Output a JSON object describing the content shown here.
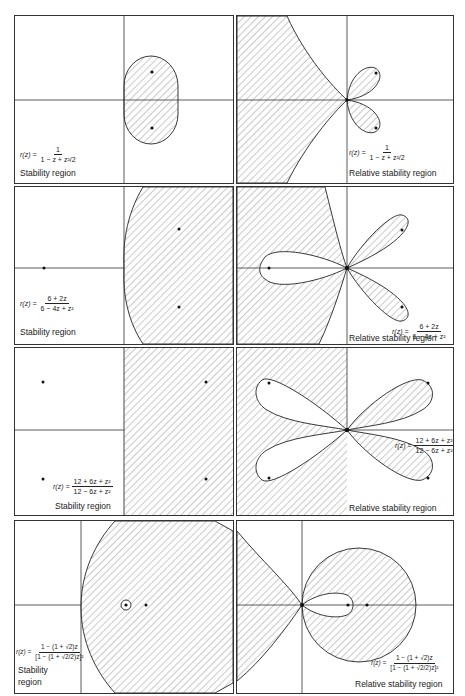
{
  "figure": {
    "columns": [
      "Stability region",
      "Relative stability region"
    ],
    "rows": [
      {
        "id": "row1",
        "formula": {
          "lhs": "r(z) =",
          "numerator": "1",
          "denominator": "1 − z + z²/2"
        },
        "stability": {
          "caption": "Stability region",
          "region": "bounded oval (stadium) right of imaginary axis, symmetric about real axis",
          "marked_points": 2
        },
        "relative": {
          "caption": "Relative stability region",
          "region": "two petals in right half-plane plus shaded unbounded region on left bounded by cusped curves",
          "marked_points": 2
        }
      },
      {
        "id": "row2",
        "formula": {
          "lhs": "r(z) =",
          "numerator": "6 + 2z",
          "denominator": "6 − 4z + z²"
        },
        "stability": {
          "caption": "Stability region",
          "region": "unbounded region right of a curve bulging into left of imaginary axis",
          "marked_points": 3
        },
        "relative": {
          "caption": "Relative stability region",
          "region": "three petals (one left, two right) meeting at origin, shaded left region",
          "marked_points": 3
        }
      },
      {
        "id": "row3",
        "formula": {
          "lhs": "r(z) =",
          "numerator": "12 + 6z + z²",
          "denominator": "12 − 6z + z²"
        },
        "stability": {
          "caption": "Stability region",
          "region": "entire right half-plane",
          "marked_points": 4
        },
        "relative": {
          "caption": "Relative stability region",
          "region": "four petals meeting at origin, left half-plane shaded except left petals",
          "marked_points": 4
        }
      },
      {
        "id": "row4",
        "formula": {
          "lhs": "r(z) =",
          "numerator": "1 − (1 + √2)z",
          "denominator": "[1 − (1 + √2/2)z]²"
        },
        "stability": {
          "caption": "Stability\nregion",
          "caption_lines": [
            "Stability",
            "region"
          ],
          "region": "large disk in right half-plane with a small circled point near its left center",
          "marked_points": 2
        },
        "relative": {
          "caption": "Relative stability region",
          "region": "disk in right half-plane with one interior petal from origin, shaded cusped region on left",
          "marked_points": 2
        }
      }
    ]
  },
  "colors": {
    "ink": "#1a1a1a",
    "hatch": "#555555",
    "background": "#ffffff"
  }
}
